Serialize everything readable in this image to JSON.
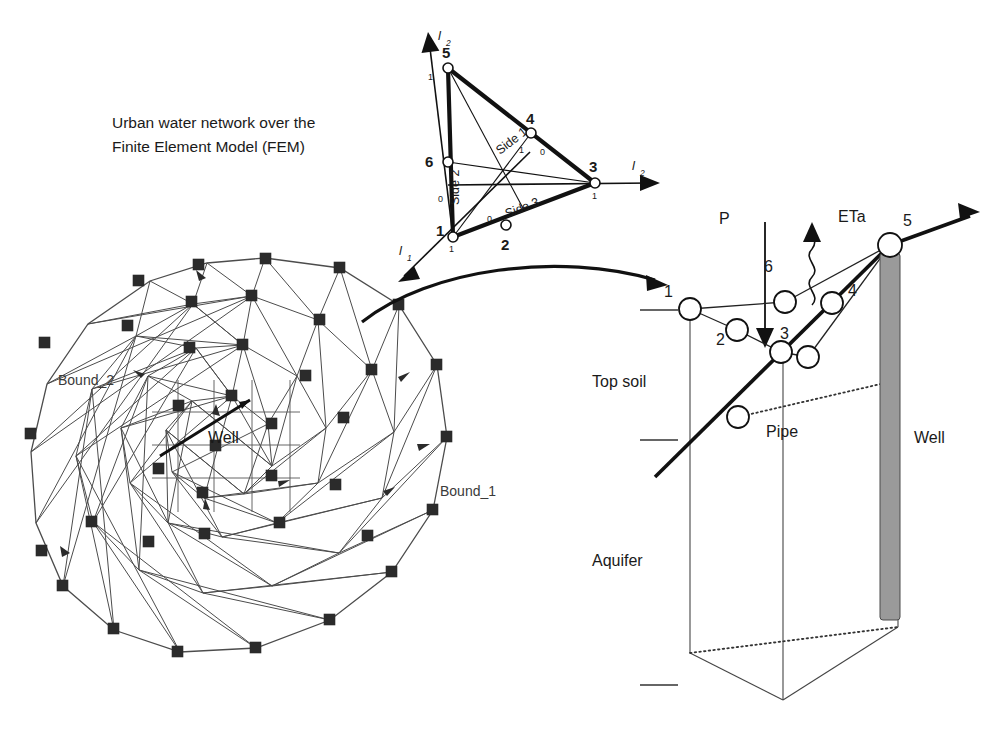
{
  "figure": {
    "title_line1": "Urban water network over the",
    "title_line2": "Finite Element Model (FEM)"
  },
  "mesh_panel": {
    "well_label": "Well",
    "bound_outer_label": "Bound_1",
    "bound_inner_label": "Bound_2",
    "node_marker": "filled-square",
    "node_count": 39,
    "outline_shape": "polygon-circle"
  },
  "element_panel": {
    "axes": [
      {
        "name": "axis-l1",
        "label": "l",
        "subscript": "1",
        "direction": "down-left"
      },
      {
        "name": "axis-l2-up",
        "label": "l",
        "subscript": "2",
        "direction": "up-left"
      },
      {
        "name": "axis-l2-right",
        "label": "l",
        "subscript": "2",
        "direction": "right"
      }
    ],
    "nodes": [
      {
        "id": "1",
        "corner": true,
        "x": 453,
        "y": 237,
        "num_x": 440,
        "num_y": 232,
        "tiny": "1",
        "tiny_x": 452,
        "tiny_y": 252
      },
      {
        "id": "2",
        "corner": false,
        "x": 506,
        "y": 225,
        "num_x": 501,
        "num_y": 247,
        "tiny": "0",
        "tiny_x": 489,
        "tiny_y": 222
      },
      {
        "id": "3",
        "corner": true,
        "x": 595,
        "y": 183,
        "num_x": 587,
        "num_y": 171,
        "tiny": "1",
        "tiny_x": 594,
        "tiny_y": 199
      },
      {
        "id": "4",
        "corner": false,
        "x": 531,
        "y": 133,
        "num_x": 524,
        "num_y": 124,
        "tiny": "0",
        "tiny_x": 541,
        "tiny_y": 155
      },
      {
        "id": "5",
        "corner": true,
        "x": 448,
        "y": 68,
        "num_x": 440,
        "num_y": 59,
        "tiny": "1",
        "tiny_x": 428,
        "tiny_y": 80
      },
      {
        "id": "6",
        "corner": false,
        "x": 448,
        "y": 162,
        "num_x": 428,
        "num_y": 160,
        "tiny": "0",
        "tiny_x": 440,
        "tiny_y": 202
      }
    ],
    "side_labels": [
      {
        "name": "side-1-label",
        "text": "Side 1",
        "x": 520,
        "y": 148,
        "rotate": -38
      },
      {
        "name": "side-2-label",
        "text": "Side 2",
        "x": 459,
        "y": 192,
        "rotate": -90
      },
      {
        "name": "side-3-label",
        "text": "Side 3",
        "x": 529,
        "y": 212,
        "rotate": -21
      }
    ],
    "center_tiny_numbers": [
      {
        "text": "1",
        "x": 521,
        "y": 153
      },
      {
        "text": "0",
        "x": 541,
        "y": 155
      },
      {
        "text": "0",
        "x": 440,
        "y": 202
      },
      {
        "text": "0",
        "x": 489,
        "y": 222
      }
    ]
  },
  "column_panel": {
    "precipitation_label": "P",
    "evapotranspiration_label": "ETa",
    "top_soil_label": "Top soil",
    "aquifer_label": "Aquifer",
    "pipe_label": "Pipe",
    "well_label": "Well",
    "network_nodes": [
      {
        "id": "1",
        "x": 690,
        "y": 309,
        "num_x": 668,
        "num_y": 296
      },
      {
        "id": "2",
        "x": 737,
        "y": 330,
        "num_x": 720,
        "num_y": 322
      },
      {
        "id": "3",
        "x": 781,
        "y": 352,
        "num_x": 783,
        "num_y": 330
      },
      {
        "id": "4",
        "x": 832,
        "y": 303,
        "num_x": 848,
        "num_y": 292
      },
      {
        "id": "5",
        "x": 890,
        "y": 245,
        "num_x": 906,
        "num_y": 222
      },
      {
        "id": "6",
        "x": 785,
        "y": 302,
        "num_x": 767,
        "num_y": 271
      }
    ],
    "extra_nodes": [
      {
        "name": "node-lower-right",
        "x": 808,
        "y": 357
      },
      {
        "name": "node-pipe-mid",
        "x": 738,
        "y": 417
      }
    ],
    "depth_ticks": [
      {
        "name": "tick-topsoil-top",
        "y": 310
      },
      {
        "name": "tick-topsoil-bottom",
        "y": 440
      },
      {
        "name": "tick-aquifer-bottom",
        "y": 685
      }
    ]
  },
  "colors": {
    "ink": "#1a1a1a",
    "mesh_line": "#4c4c4c",
    "mesh_node": "#2b2b2b",
    "well_fill": "#9a9a9a",
    "background": "#ffffff"
  }
}
